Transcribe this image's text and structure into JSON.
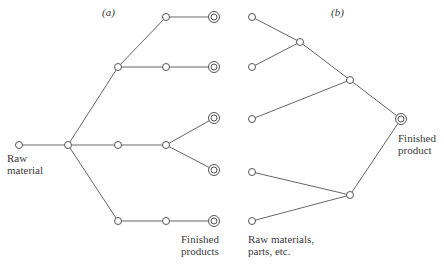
{
  "diagram": {
    "panel_a": {
      "title": "(a)",
      "start_label_line1": "Raw",
      "start_label_line2": "material",
      "end_label_line1": "Finished",
      "end_label_line2": "products"
    },
    "panel_b": {
      "title": "(b)",
      "start_label_line1": "Raw materials,",
      "start_label_line2": "parts, etc.",
      "end_label_line1": "Finished",
      "end_label_line2": "product"
    },
    "colors": {
      "line": "#666666",
      "text": "#3a3a3a",
      "background": "#ffffff"
    }
  }
}
